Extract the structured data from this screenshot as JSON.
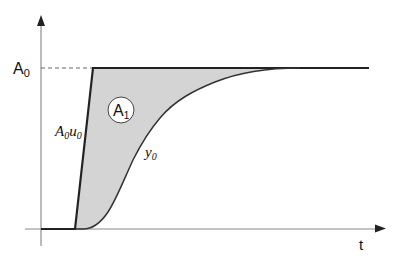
{
  "diagram": {
    "type": "step-response-area",
    "colors": {
      "axis": "#777777",
      "curve": "#222222",
      "fill": "#d4d4d4",
      "dashed": "#666666",
      "background": "#ffffff"
    },
    "labels": {
      "y_level": "A",
      "y_level_sub": "0",
      "area": "A",
      "area_sub": "1",
      "ramp_a": "A",
      "ramp_a_sub": "0",
      "ramp_u": "u",
      "ramp_u_sub": "0",
      "curve": "y",
      "curve_sub": "0",
      "x_axis": "t"
    }
  }
}
